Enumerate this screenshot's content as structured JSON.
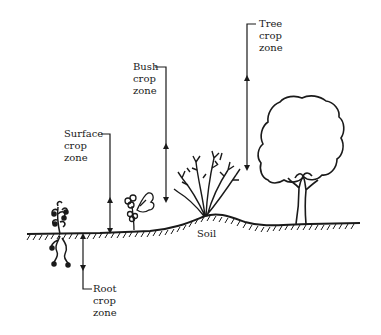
{
  "diagram": {
    "zones": [
      {
        "id": "surface",
        "lines": [
          "Surface",
          "crop",
          "zone"
        ]
      },
      {
        "id": "bush",
        "lines": [
          "Bush",
          "crop",
          "zone"
        ]
      },
      {
        "id": "tree",
        "lines": [
          "Tree",
          "crop",
          "zone"
        ]
      },
      {
        "id": "root",
        "lines": [
          "Root",
          "crop",
          "zone"
        ]
      }
    ],
    "ground_label": "Soil",
    "colors": {
      "ink": "#1a1a1a",
      "background": "#ffffff"
    }
  }
}
